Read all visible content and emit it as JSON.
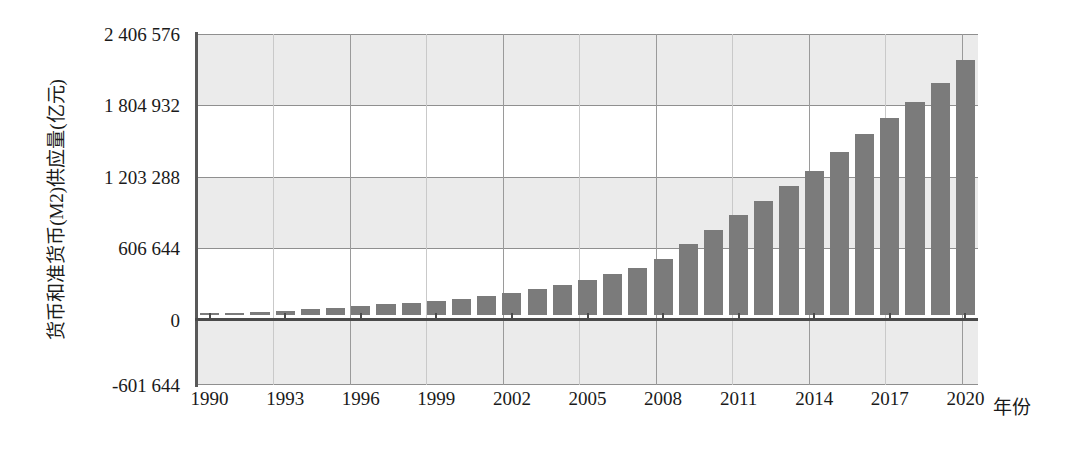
{
  "chart_data": {
    "type": "bar",
    "title": "",
    "xlabel": "年份",
    "ylabel": "货币和准货币(M2)供应量(亿元)",
    "categories": [
      "1990",
      "1991",
      "1992",
      "1993",
      "1994",
      "1995",
      "1996",
      "1997",
      "1998",
      "1999",
      "2000",
      "2001",
      "2002",
      "2003",
      "2004",
      "2005",
      "2006",
      "2007",
      "2008",
      "2009",
      "2010",
      "2011",
      "2012",
      "2013",
      "2014",
      "2015",
      "2016",
      "2017",
      "2018",
      "2019",
      "2020"
    ],
    "values": [
      15293,
      19350,
      25402,
      34880,
      46924,
      60751,
      76095,
      90996,
      104499,
      119898,
      134610,
      158302,
      185007,
      221223,
      254107,
      298756,
      345604,
      403442,
      475167,
      606225,
      725852,
      851591,
      974149,
      1106525,
      1228375,
      1392278,
      1550067,
      1690235,
      1826744,
      1986489,
      2186796
    ],
    "series_name": "货币和准货币(M2)供应量",
    "ylim": [
      -601644,
      2406576
    ],
    "yticks": [
      -601644,
      0,
      606644,
      1203288,
      1804932,
      2406576
    ],
    "ytick_labels": [
      "-601 644",
      "0",
      "606 644",
      "1 203 288",
      "1 804 932",
      "2 406 576"
    ],
    "xtick_labels": [
      "1990",
      "1993",
      "1996",
      "1999",
      "2002",
      "2005",
      "2008",
      "2011",
      "2014",
      "2017",
      "2020"
    ],
    "grid": true,
    "legend": "none",
    "bar_color": "#7b7b7b",
    "band_color": "#ebebeb",
    "axis_color": "#4a4a4a",
    "gridline_color": "#8f8f8f"
  },
  "axis": {
    "y_title": "货币和准货币(M2)供应量(亿元)",
    "x_title": "年份"
  }
}
